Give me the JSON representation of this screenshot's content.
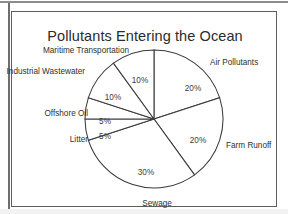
{
  "chart_data": {
    "type": "pie",
    "title": "Pollutants Entering the Ocean",
    "xlabel": "",
    "ylabel": "",
    "legend": "none",
    "grid": false,
    "start_angle_deg": 90,
    "direction": "clockwise",
    "categories": [
      "Air Pollutants",
      "Farm Runoff",
      "Sewage",
      "Litter",
      "Offshore Oil",
      "Industrial Wastewater",
      "Maritime Transportation"
    ],
    "values": [
      20,
      20,
      30,
      5,
      5,
      10,
      10
    ],
    "value_labels": [
      "20%",
      "20%",
      "30%",
      "5%",
      "5%",
      "10%",
      "10%"
    ],
    "units": "percent",
    "total": 100,
    "slices": [
      {
        "label": "Air Pollutants",
        "value": 20,
        "value_label": "20%",
        "angle_deg": 72,
        "pct_label_x": 181,
        "pct_label_y": 79,
        "cat_label_x": 198,
        "cat_label_y": 53,
        "cat_anchor": "start"
      },
      {
        "label": "Farm Runoff",
        "value": 20,
        "value_label": "20%",
        "angle_deg": 72,
        "pct_label_x": 186,
        "pct_label_y": 131,
        "cat_label_x": 214,
        "cat_label_y": 136,
        "cat_anchor": "start"
      },
      {
        "label": "Sewage",
        "value": 30,
        "value_label": "30%",
        "angle_deg": 108,
        "pct_label_x": 134,
        "pct_label_y": 163,
        "cat_label_x": 145,
        "cat_label_y": 194,
        "cat_anchor": "middle"
      },
      {
        "label": "Litter",
        "value": 5,
        "value_label": "5%",
        "angle_deg": 18,
        "pct_label_x": 93,
        "pct_label_y": 127,
        "cat_label_x": 76,
        "cat_label_y": 130,
        "cat_anchor": "end"
      },
      {
        "label": "Offshore Oil",
        "value": 5,
        "value_label": "5%",
        "angle_deg": 18,
        "pct_label_x": 93,
        "pct_label_y": 112,
        "cat_label_x": 76,
        "cat_label_y": 104,
        "cat_anchor": "end"
      },
      {
        "label": "Industrial Wastewater",
        "value": 10,
        "value_label": "10%",
        "angle_deg": 36,
        "pct_label_x": 101,
        "pct_label_y": 88,
        "cat_label_x": 73,
        "cat_label_y": 62,
        "cat_anchor": "end"
      },
      {
        "label": "Maritime Transportation",
        "value": 10,
        "value_label": "10%",
        "angle_deg": 36,
        "pct_label_x": 128,
        "pct_label_y": 71,
        "cat_label_x": 117,
        "cat_label_y": 41,
        "cat_anchor": "end"
      }
    ],
    "geometry": {
      "cx": 142,
      "cy": 107,
      "r": 69
    },
    "colors": {
      "slice_fill": "#ffffff",
      "slice_stroke": "#3a3a3a",
      "text": "#2f2f2f",
      "frame": "#5e5e5e"
    }
  }
}
